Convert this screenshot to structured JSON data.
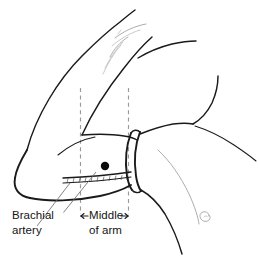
{
  "figure": {
    "title": "Blood pressure cuff placement on upper arm",
    "background_color": "#ffffff",
    "ink_color": "#1a1a1a",
    "guide_color": "#9a9a9e",
    "marker_color": "#0a0a0a"
  },
  "labels": {
    "brachial": {
      "line1": "Brachial",
      "line2": "artery",
      "name": "brachial-artery-label"
    },
    "middle": {
      "line1": "Middle",
      "line2": "of arm",
      "name": "middle-of-arm-label"
    }
  },
  "markers": {
    "artery_dot": {
      "name": "brachial-artery-dot",
      "x": 105,
      "y": 166,
      "r": 4.2,
      "color": "#0a0a0a"
    },
    "left_guide_x": 80.5,
    "right_guide_x": 128.5,
    "guide_top_y": 88,
    "guide_bottom_y": 215
  },
  "annotations": {
    "left_arrow": "←",
    "right_arrow": "→"
  }
}
